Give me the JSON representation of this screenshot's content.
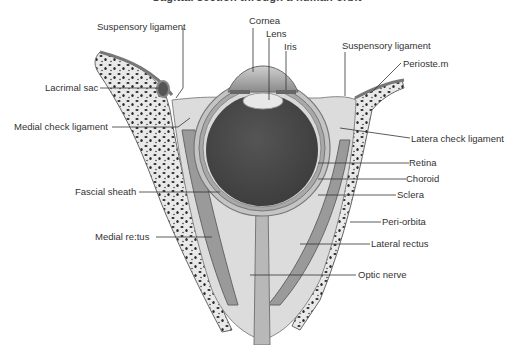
{
  "title": "Sagittal section through a human orbit",
  "labels": {
    "suspensory_ligament_left": "Suspensory ligament",
    "cornea": "Cornea",
    "lens": "Lens",
    "iris": "Iris",
    "suspensory_ligament_right": "Suspensory ligament",
    "periosteum": "Perioste.m",
    "lacrimal_sac": "Lacrimal sac",
    "medial_check_ligament": "Medial check ligament",
    "lateral_check_ligament": "Latera check ligament",
    "retina": "Retina",
    "choroid": "Choroid",
    "sclera": "Sclera",
    "fascial_sheath": "Fascial sheath",
    "peri_orbita": "Peri-orbita",
    "medial_rectus": "Medial re:tus",
    "lateral_rectus": "Lateral rectus",
    "optic_nerve": "Optic nerve"
  },
  "colors": {
    "bone_fill": "#e6e6e6",
    "bone_dots": "#2a2a2a",
    "fat_fill": "#d7d7d7",
    "muscle": "#9a9a9a",
    "eye_interior": "#4a4a4a",
    "sclera": "#bdbdbd",
    "line": "#333333"
  }
}
